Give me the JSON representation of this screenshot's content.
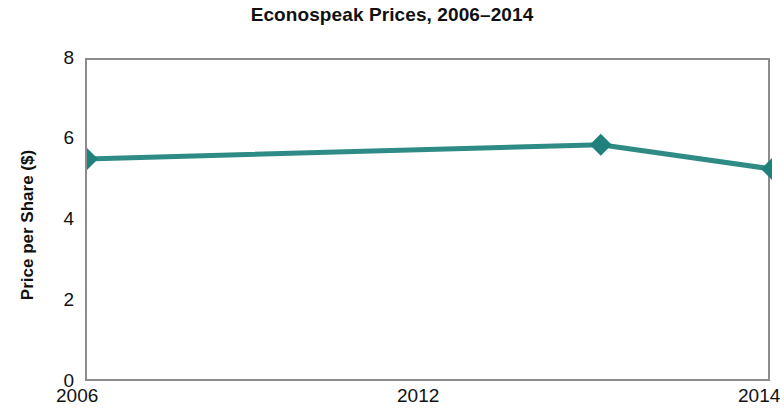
{
  "chart_data": {
    "type": "line",
    "title": "Econospeak Prices, 2006–2014",
    "xlabel": "",
    "ylabel": "Price per Share ($)",
    "x": [
      2006,
      2012,
      2014
    ],
    "categories": [
      "2006",
      "2012",
      "2014"
    ],
    "values": [
      5.55,
      5.9,
      5.3
    ],
    "series": [
      {
        "name": "Econospeak",
        "values": [
          5.55,
          5.9,
          5.3
        ]
      }
    ],
    "xlim": [
      2006,
      2014
    ],
    "ylim": [
      0,
      8
    ],
    "x_tick_labels": [
      "2006",
      "2012",
      "2014"
    ],
    "x_tick_values": [
      2006,
      2012,
      2014
    ],
    "y_tick_labels": [
      "0",
      "2",
      "4",
      "6",
      "8"
    ],
    "y_tick_values": [
      0,
      2,
      4,
      6,
      8
    ],
    "grid": false,
    "legend": false,
    "legend_position": "none",
    "marker": "diamond",
    "line_color": "#2e8b86",
    "marker_color": "#20807b",
    "axis_color": "#8c8c8c",
    "background_color": "#ffffff",
    "text_color": "#111111"
  },
  "axes": {
    "y_ticks": [
      {
        "label": "8",
        "value": 8,
        "tick_mark": false
      },
      {
        "label": "6",
        "value": 6,
        "tick_mark": true
      },
      {
        "label": "4",
        "value": 4,
        "tick_mark": true
      },
      {
        "label": "2",
        "value": 2,
        "tick_mark": true
      },
      {
        "label": "0",
        "value": 0,
        "tick_mark": false
      }
    ],
    "x_ticks": [
      {
        "label": "2006",
        "value": 2006,
        "tick_mark": false
      },
      {
        "label": "2012",
        "value": 2012,
        "tick_mark": true
      },
      {
        "label": "2014",
        "value": 2014,
        "tick_mark": false
      }
    ]
  }
}
